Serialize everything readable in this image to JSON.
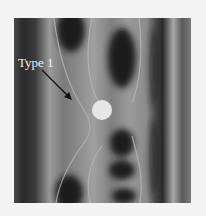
{
  "figure": {
    "label": "Type 1",
    "colors": {
      "background": "#f4f4f4",
      "field_dark": "#1e1e1e",
      "field_mid": "#6a6a6a",
      "field_light": "#a8a8a8",
      "cylinder": "#e6e6e6",
      "label_text": "#f2f2f2",
      "arrow": "#111111"
    }
  }
}
